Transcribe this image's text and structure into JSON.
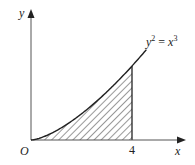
{
  "diagram": {
    "axes": {
      "x_label": "x",
      "y_label": "y",
      "origin_label": "O",
      "x_tick_label": "4"
    },
    "curve": {
      "equation_lhs": "y",
      "equation_lhs_exp": "2",
      "equation_eq": " = ",
      "equation_rhs": "x",
      "equation_rhs_exp": "3"
    },
    "shaded_region": {
      "from_x": 0,
      "to_x": 4,
      "fill": "hatched"
    },
    "colors": {
      "axis": "#555555",
      "curve": "#222222",
      "hatch": "#333333"
    }
  },
  "chart_data": {
    "type": "line",
    "title": "",
    "xlabel": "x",
    "ylabel": "y",
    "series": [
      {
        "name": "y^2 = x^3",
        "x": [
          0,
          0.5,
          1,
          1.5,
          2,
          2.5,
          3,
          3.5,
          4,
          4.5
        ],
        "values": [
          0,
          0.354,
          1,
          1.837,
          2.828,
          3.953,
          5.196,
          6.548,
          8,
          9.546
        ]
      }
    ],
    "x_ticks": [
      "O",
      "4"
    ],
    "shaded_area": {
      "x_from": 0,
      "x_to": 4,
      "bounded_by": "curve, x-axis, x=4"
    },
    "grid": false,
    "legend": "none"
  }
}
